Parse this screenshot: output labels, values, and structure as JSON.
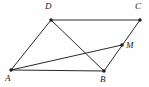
{
  "figure": {
    "kind": "parallelogram-with-diagonals",
    "background_color": "#fefefe",
    "line_color": "#2a2a2a",
    "label_color": "#1a1a1a",
    "points": {
      "A": {
        "label": "A",
        "x": 11,
        "y": 70,
        "label_x": 5,
        "label_y": 74
      },
      "B": {
        "label": "B",
        "x": 104,
        "y": 71,
        "label_x": 100,
        "label_y": 75
      },
      "C": {
        "label": "C",
        "x": 140,
        "y": 20,
        "label_x": 135,
        "label_y": 2
      },
      "D": {
        "label": "D",
        "x": 51,
        "y": 20,
        "label_x": 45,
        "label_y": 2
      },
      "M": {
        "label": "M",
        "x": 122,
        "y": 45,
        "label_x": 126,
        "label_y": 43
      }
    },
    "segments": [
      {
        "name": "side-AB",
        "from": "A",
        "to": "B"
      },
      {
        "name": "side-BC",
        "from": "B",
        "to": "C"
      },
      {
        "name": "side-CD",
        "from": "C",
        "to": "D"
      },
      {
        "name": "side-DA",
        "from": "D",
        "to": "A"
      },
      {
        "name": "diagonal-DB",
        "from": "D",
        "to": "B"
      },
      {
        "name": "cevian-AM",
        "from": "A",
        "to": "M"
      },
      {
        "name": "cevian-AC",
        "from": "A",
        "to": "C"
      }
    ]
  }
}
